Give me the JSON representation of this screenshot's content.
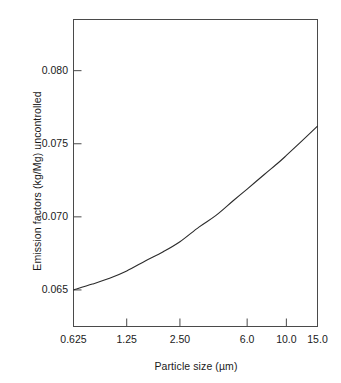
{
  "chart_data": {
    "type": "line",
    "title": "",
    "xlabel": "Particle size (µm)",
    "ylabel": "Emission factors (kg/Mg) uncontrolled",
    "x_tick_labels": [
      "0.625",
      "1.25",
      "2.50",
      "6.0",
      "10.0",
      "15.0"
    ],
    "x_tick_values": [
      0.625,
      1.25,
      2.5,
      6.0,
      10.0,
      15.0
    ],
    "y_tick_labels": [
      "0.065",
      "0.070",
      "0.075",
      "0.080"
    ],
    "y_tick_values": [
      0.065,
      0.07,
      0.075,
      0.08
    ],
    "ylim": [
      0.0625,
      0.0835
    ],
    "xscale": "log",
    "grid": false,
    "legend": null,
    "line_color": "#2b2b2b",
    "frame_color": "#4a4a4a",
    "series": [
      {
        "name": "uncontrolled emission factor",
        "x": [
          0.625,
          1.25,
          2.5,
          6.0,
          10.0,
          15.0
        ],
        "values": [
          0.065,
          0.0663,
          0.0683,
          0.0719,
          0.0742,
          0.0762
        ]
      }
    ],
    "points_detail": {
      "x": [
        0.625,
        0.8,
        1.0,
        1.25,
        1.6,
        2.0,
        2.5,
        3.2,
        4.0,
        5.0,
        6.0,
        7.5,
        9.0,
        10.0,
        12.0,
        15.0
      ],
      "y": [
        0.065,
        0.0654,
        0.0658,
        0.0663,
        0.067,
        0.0676,
        0.0683,
        0.0693,
        0.0701,
        0.0711,
        0.0719,
        0.0729,
        0.0737,
        0.0742,
        0.0751,
        0.0762
      ]
    },
    "annotations": []
  },
  "axis": {
    "y_label_text": "Emission factors (kg/Mg) uncontrolled",
    "x_label_text": "Particle size (µm)"
  }
}
